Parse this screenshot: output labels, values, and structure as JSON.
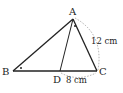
{
  "diagram": {
    "type": "triangle",
    "points": {
      "A": {
        "label": "A",
        "x": 73,
        "y": 19
      },
      "B": {
        "label": "B",
        "x": 13,
        "y": 71
      },
      "C": {
        "label": "C",
        "x": 97,
        "y": 71
      },
      "D": {
        "label": "D",
        "x": 60,
        "y": 71
      }
    },
    "segments": [
      "AB",
      "AC",
      "BC",
      "AD"
    ],
    "measurements": [
      {
        "segment": "AC",
        "label": "12 cm"
      },
      {
        "segment": "DC",
        "label": "8 cm"
      }
    ],
    "angle_marks": [
      "angle ABC",
      "angle DAC"
    ],
    "colors": {
      "line": "#222222",
      "dotted": "#999999"
    }
  }
}
